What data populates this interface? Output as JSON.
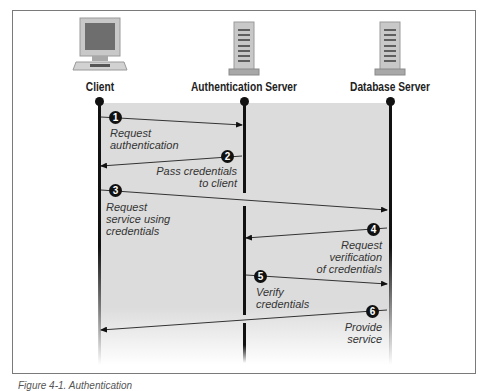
{
  "actors": [
    {
      "name": "Client",
      "icon": "computer-monitor-icon"
    },
    {
      "name": "Authentication Server",
      "icon": "server-tower-icon"
    },
    {
      "name": "Database Server",
      "icon": "server-tower-icon"
    }
  ],
  "steps": [
    {
      "number": "1",
      "from": "Client",
      "to": "Authentication Server",
      "label": "Request\nauthentication"
    },
    {
      "number": "2",
      "from": "Authentication Server",
      "to": "Client",
      "label": "Pass credentials\nto client"
    },
    {
      "number": "3",
      "from": "Client",
      "to": "Database Server",
      "label": "Request\nservice using\ncredentials"
    },
    {
      "number": "4",
      "from": "Database Server",
      "to": "Authentication Server",
      "label": "Request\nverification\nof credentials"
    },
    {
      "number": "5",
      "from": "Authentication Server",
      "to": "Database Server",
      "label": "Verify\ncredentials"
    },
    {
      "number": "6",
      "from": "Database Server",
      "to": "Client",
      "label": "Provide\nservice"
    }
  ],
  "caption": "Figure 4-1. Authentication"
}
